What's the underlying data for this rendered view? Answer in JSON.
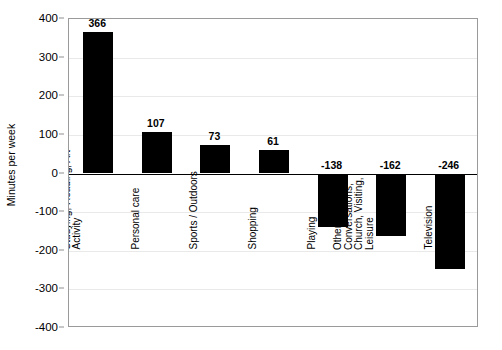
{
  "chart_data": {
    "type": "bar",
    "title": "",
    "subtitle": "",
    "xlabel": "",
    "ylabel": "Minutes per week",
    "ylim": [
      -400,
      400
    ],
    "yticks": [
      400,
      300,
      200,
      100,
      0,
      -100,
      -200,
      -300,
      -400
    ],
    "ytick_labels": [
      "400",
      "300",
      "200",
      "100",
      "0",
      "-100",
      "-200",
      "-300",
      "-400"
    ],
    "grid": false,
    "legend": "none",
    "bar_color": "#000000",
    "categories": [
      "School, Daycare Studying, Reading, Art Activity",
      "Personal care",
      "Sports / Outdoors",
      "Shopping",
      "Playing",
      "Other passive, Conversations, Church, Visiting, Leisure",
      "Television"
    ],
    "category_lines": [
      [
        "School, Daycare",
        "Studying, Reading, Art",
        "Activity"
      ],
      [
        "Personal care"
      ],
      [
        "Sports / Outdoors"
      ],
      [
        "Shopping"
      ],
      [
        "Playing"
      ],
      [
        "Other passive,",
        "Conversations,",
        "Church, Visiting,",
        "Leisure"
      ],
      [
        "Television"
      ]
    ],
    "values": [
      366,
      107,
      73,
      61,
      -138,
      -162,
      -246
    ],
    "value_labels": [
      "366",
      "107",
      "73",
      "61",
      "-138",
      "-162",
      "-246"
    ]
  }
}
